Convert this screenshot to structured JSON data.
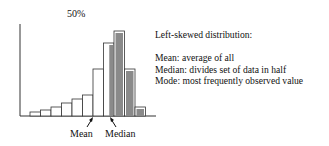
{
  "chart_data": {
    "type": "bar",
    "title": "Left-skewed distribution",
    "top_label": "50%",
    "categories": [
      "1",
      "2",
      "3",
      "4",
      "5",
      "6",
      "7",
      "8",
      "9",
      "10",
      "11"
    ],
    "values": [
      4,
      6,
      9,
      13,
      17,
      21,
      47,
      73,
      85,
      47,
      9
    ],
    "shaded": [
      false,
      false,
      false,
      false,
      false,
      false,
      false,
      "partial",
      true,
      true,
      true
    ],
    "xlabel": "",
    "ylabel": "",
    "grid": false,
    "annotations": [
      {
        "text": "Mean",
        "arrow_target_bar_index": 6
      },
      {
        "text": "Median",
        "arrow_target_bar_index": 7
      }
    ],
    "colors": {
      "outline": "#333333",
      "fill_white": "#ffffff",
      "fill_shaded": "#8a8a8a"
    }
  },
  "description": {
    "title": "Left-skewed distribution:",
    "lines": [
      "Mean: average of all",
      "Median: divides set of data in half",
      "Mode: most frequently observed value"
    ]
  },
  "labels": {
    "pct": "50%",
    "mean": "Mean",
    "median": "Median"
  }
}
